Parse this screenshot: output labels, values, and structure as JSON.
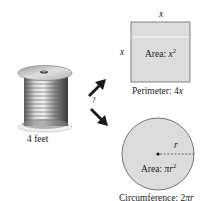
{
  "spool": {
    "label": "4 feet"
  },
  "question_mark": "?",
  "square": {
    "side_top_var": "x",
    "side_left_var": "x",
    "area_prefix": "Area: ",
    "area_var": "x",
    "area_exp": "2",
    "perimeter_prefix": "Perimeter: 4",
    "perimeter_var": "x",
    "fill": "#dcdcdc",
    "stroke": "#666666"
  },
  "circle": {
    "radius_var": "r",
    "area_prefix": "Area: ",
    "area_expr": "πr",
    "area_exp": "2",
    "circumference_prefix": "Circumference: 2",
    "circumference_var": "πr",
    "fill": "#dcdcdc",
    "stroke": "#555555"
  },
  "colors": {
    "arrow": "#1a1a1a",
    "background": "#ffffff"
  }
}
